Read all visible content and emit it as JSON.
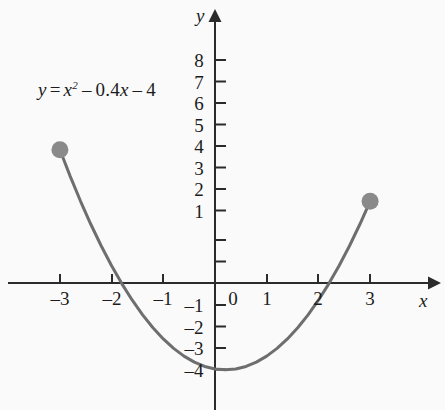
{
  "chart_data": {
    "type": "line",
    "title": "",
    "annotation": "y = x² − 0.4x − 4",
    "equation_parts": {
      "lhs": "y",
      "equals": "=",
      "var": "x",
      "exponent": "2",
      "minus1": "–",
      "coefficient": "0.4",
      "var2": "x",
      "minus2": "–",
      "constant": "4"
    },
    "xlabel": "x",
    "ylabel": "y",
    "xlim": [
      -3.55,
      4.25
    ],
    "ylim": [
      -5.3,
      9.3
    ],
    "grid": false,
    "legend": false,
    "x_ticks": [
      -3,
      -2,
      -1,
      0,
      1,
      2,
      3
    ],
    "x_tick_labels": [
      "–3",
      "–2",
      "–1",
      "0",
      "1",
      "2",
      "3"
    ],
    "y_ticks": [
      -4,
      -3,
      -2,
      -1,
      1,
      2,
      3,
      4,
      5,
      6,
      7,
      8
    ],
    "y_tick_labels": [
      "–4",
      "–3",
      "–2",
      "–1",
      "1",
      "2",
      "3",
      "4",
      "5",
      "6",
      "7",
      "8"
    ],
    "series": [
      {
        "name": "y = x^2 - 0.4x - 4",
        "domain": [
          -3,
          3
        ],
        "color": "#6e6e6e",
        "x": [
          -3,
          -2.8,
          -2.6,
          -2.4,
          -2.2,
          -2,
          -1.8,
          -1.6,
          -1.4,
          -1.2,
          -1,
          -0.8,
          -0.6,
          -0.4,
          -0.2,
          0,
          0.2,
          0.4,
          0.6,
          0.8,
          1,
          1.2,
          1.4,
          1.6,
          1.8,
          2,
          2.2,
          2.4,
          2.6,
          2.8,
          3
        ],
        "y": [
          6.2,
          4.96,
          3.8,
          2.72,
          1.72,
          0.8,
          -0.04,
          -0.8,
          -1.48,
          -2.08,
          -2.6,
          -3.04,
          -3.4,
          -3.68,
          -3.88,
          -4,
          -4.04,
          -4,
          -3.88,
          -3.68,
          -3.4,
          -3.04,
          -2.6,
          -2.08,
          -1.48,
          -0.8,
          -0.04,
          0.8,
          1.72,
          2.72,
          3.8
        ]
      }
    ],
    "endpoints": [
      {
        "x": -3,
        "y": 6.2,
        "marker": "filled-circle",
        "color": "#8a8a8a"
      },
      {
        "x": 3,
        "y": 3.8,
        "marker": "filled-circle",
        "color": "#8a8a8a"
      }
    ],
    "x_intercepts": [
      -1.82,
      2.22
    ],
    "vertex": {
      "x": 0.2,
      "y": -4.04
    },
    "axis_color": "#2b2b2b"
  }
}
